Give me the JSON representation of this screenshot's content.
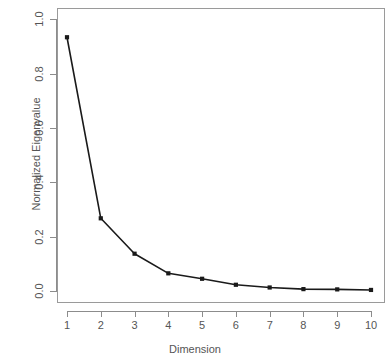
{
  "chart_data": {
    "type": "line",
    "title": "",
    "xlabel": "Dimension",
    "ylabel": "Normalized Eigenvalue",
    "x": [
      1,
      2,
      3,
      4,
      5,
      6,
      7,
      8,
      9,
      10
    ],
    "categories": [
      "1",
      "2",
      "3",
      "4",
      "5",
      "6",
      "7",
      "8",
      "9",
      "10"
    ],
    "values": [
      0.933,
      0.268,
      0.138,
      0.066,
      0.046,
      0.024,
      0.014,
      0.008,
      0.007,
      0.005
    ],
    "series": [
      {
        "name": "Normalized Eigenvalue",
        "values": [
          0.933,
          0.268,
          0.138,
          0.066,
          0.046,
          0.024,
          0.014,
          0.008,
          0.007,
          0.005
        ]
      }
    ],
    "xlim": [
      1,
      10
    ],
    "ylim": [
      0.0,
      1.0
    ],
    "xticks": [
      1,
      2,
      3,
      4,
      5,
      6,
      7,
      8,
      9,
      10
    ],
    "xtick_labels": [
      "1",
      "2",
      "3",
      "4",
      "5",
      "6",
      "7",
      "8",
      "9",
      "10"
    ],
    "yticks": [
      0.0,
      0.2,
      0.4,
      0.6,
      0.8,
      1.0
    ],
    "ytick_labels": [
      "0.0",
      "0.2",
      "0.4",
      "0.6",
      "0.8",
      "1.0"
    ],
    "grid": false,
    "legend": false,
    "legend_position": "none",
    "line_color": "#1a1a1a",
    "marker": "square",
    "marker_color": "#1a1a1a",
    "background_color": "#ffffff",
    "frame_color": "#9a9a9a",
    "annotations": []
  }
}
